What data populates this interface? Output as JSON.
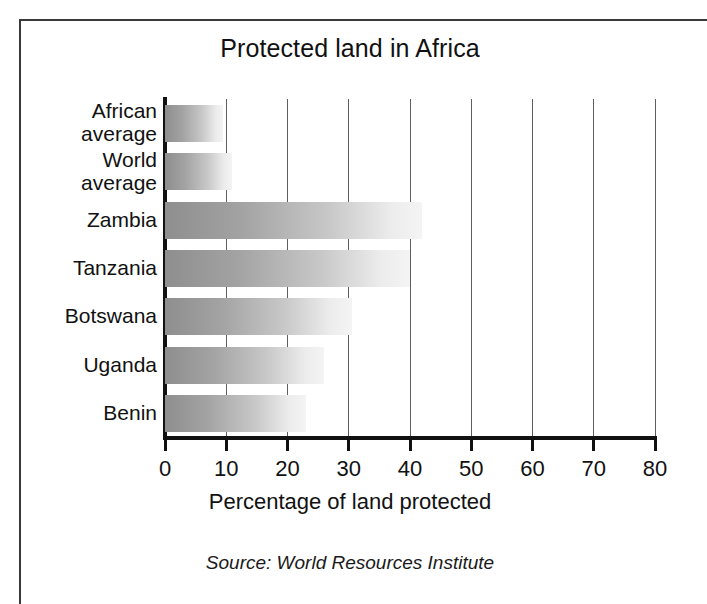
{
  "figure": {
    "background_color": "#ffffff",
    "frame_color": "#3a3a3a",
    "axis_color": "#111111",
    "gridline_color": "#5e5e5e",
    "bar_gradient_start": "#8e8e8e",
    "bar_gradient_end": "#f4f4f4"
  },
  "source_note": "Source: World Resources Institute",
  "chart_data": {
    "type": "bar",
    "orientation": "horizontal",
    "title": "Protected land in Africa",
    "xlabel": "Percentage of land protected",
    "ylabel": "",
    "categories": [
      "African average",
      "World average",
      "Zambia",
      "Tanzania",
      "Botswana",
      "Uganda",
      "Benin"
    ],
    "category_lines": [
      [
        "African",
        "average"
      ],
      [
        "World",
        "average"
      ],
      [
        "Zambia"
      ],
      [
        "Tanzania"
      ],
      [
        "Botswana"
      ],
      [
        "Uganda"
      ],
      [
        "Benin"
      ]
    ],
    "values": [
      9.5,
      11,
      42,
      40,
      30.5,
      26,
      23
    ],
    "xlim": [
      0,
      80
    ],
    "xticks": [
      0,
      10,
      20,
      30,
      40,
      50,
      60,
      70,
      80
    ],
    "xtick_labels": [
      "0",
      "10",
      "20",
      "30",
      "40",
      "50",
      "60",
      "70",
      "80"
    ],
    "grid": "vertical",
    "legend": "none"
  }
}
